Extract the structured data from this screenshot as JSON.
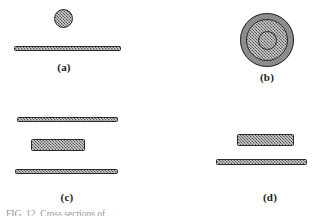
{
  "figure": {
    "background_color": "#ffffff",
    "ink_color": "#2b2b2b",
    "fill_color": "#8d8d8d",
    "caption_fragment": "FIG. 12.  Cross sections of ...",
    "panels": [
      {
        "id": "a",
        "label": "(a)",
        "objects": [
          {
            "name": "disc",
            "shape": "circle"
          },
          {
            "name": "slab",
            "shape": "thin-bar"
          }
        ]
      },
      {
        "id": "b",
        "label": "(b)",
        "objects": [
          {
            "name": "annulus",
            "shape": "ring"
          },
          {
            "name": "core-disc",
            "shape": "circle"
          }
        ]
      },
      {
        "id": "c",
        "label": "(c)",
        "objects": [
          {
            "name": "upper-slab",
            "shape": "thin-bar"
          },
          {
            "name": "middle-block",
            "shape": "thick-bar"
          },
          {
            "name": "lower-slab",
            "shape": "thin-bar"
          }
        ]
      },
      {
        "id": "d",
        "label": "(d)",
        "objects": [
          {
            "name": "upper-block",
            "shape": "thick-bar"
          },
          {
            "name": "lower-slab",
            "shape": "thin-bar"
          }
        ]
      }
    ]
  }
}
